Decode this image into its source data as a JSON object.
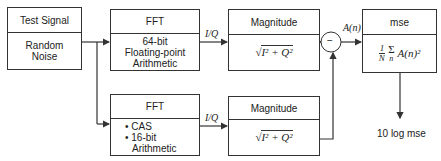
{
  "blocks": {
    "test_signal": {
      "header": "Test Signal",
      "body": [
        "Random",
        "Noise"
      ]
    },
    "fft_reference": {
      "header": "FFT",
      "body": [
        "64-bit",
        "Floating-point",
        "Arithmetic"
      ]
    },
    "fft_test": {
      "header": "FFT",
      "bullets": [
        "CAS",
        "16-bit"
      ],
      "body_tail": "Arithmetic"
    },
    "magnitude_reference": {
      "header": "Magnitude",
      "formula": "√(I² + Q²)"
    },
    "magnitude_test": {
      "header": "Magnitude",
      "formula": "√(I² + Q²)"
    },
    "mse": {
      "header": "mse",
      "formula": "1/N Σₙ A(n)²"
    }
  },
  "labels": {
    "iq_top": "I/Q",
    "iq_bottom": "I/Q",
    "subtract": "−",
    "difference": "A(n)",
    "output": "10 log mse"
  },
  "formula_parts": {
    "sqrt": "√",
    "mag_expr": "I² + Q²",
    "one": "1",
    "N": "N",
    "sigma": "Σ",
    "n": "n",
    "A_sq": "A(n)²"
  },
  "colors": {
    "line": "#333333",
    "text": "#222222",
    "background": "#ffffff"
  }
}
